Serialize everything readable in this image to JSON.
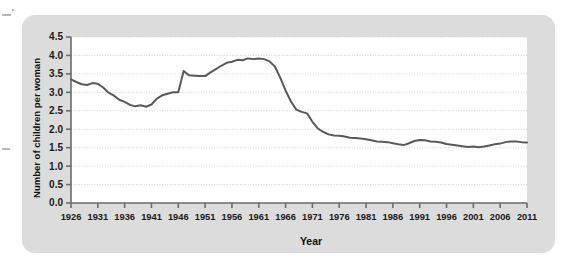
{
  "figure": {
    "panel_background": "#dcdcdc",
    "plot_background": "#ffffff",
    "line_color": "#595959",
    "grid_color": "#c8c8c8",
    "axis_color": "#6b6b6b"
  },
  "chart_data": {
    "type": "line",
    "title": "",
    "xlabel": "Year",
    "ylabel": "Number of children per woman",
    "xlim": [
      1926,
      2011
    ],
    "ylim": [
      0.0,
      4.5
    ],
    "grid": true,
    "legend": null,
    "xticks": [
      1926,
      1931,
      1936,
      1941,
      1946,
      1951,
      1956,
      1961,
      1966,
      1971,
      1976,
      1981,
      1986,
      1991,
      1996,
      2001,
      2006,
      2011
    ],
    "xtick_labels": [
      "1926",
      "1931",
      "1936",
      "1941",
      "1946",
      "1951",
      "1956",
      "1961",
      "1966",
      "1971",
      "1976",
      "1981",
      "1986",
      "1991",
      "1996",
      "2001",
      "2006",
      "2011"
    ],
    "yticks": [
      0.0,
      0.5,
      1.0,
      1.5,
      2.0,
      2.5,
      3.0,
      3.5,
      4.0,
      4.5
    ],
    "ytick_labels": [
      "0.0",
      "0.5",
      "1.0",
      "1.5",
      "2.0",
      "2.5",
      "3.0",
      "3.5",
      "4.0",
      "4.5"
    ],
    "series": [
      {
        "name": "Total fertility rate",
        "x": [
          1926,
          1927,
          1928,
          1929,
          1930,
          1931,
          1932,
          1933,
          1934,
          1935,
          1936,
          1937,
          1938,
          1939,
          1940,
          1941,
          1942,
          1943,
          1944,
          1945,
          1946,
          1947,
          1948,
          1949,
          1950,
          1951,
          1952,
          1953,
          1954,
          1955,
          1956,
          1957,
          1958,
          1959,
          1960,
          1961,
          1962,
          1963,
          1964,
          1965,
          1966,
          1967,
          1968,
          1969,
          1970,
          1971,
          1972,
          1973,
          1974,
          1975,
          1976,
          1977,
          1978,
          1979,
          1980,
          1981,
          1982,
          1983,
          1984,
          1985,
          1986,
          1987,
          1988,
          1989,
          1990,
          1991,
          1992,
          1993,
          1994,
          1995,
          1996,
          1997,
          1998,
          1999,
          2000,
          2001,
          2002,
          2003,
          2004,
          2005,
          2006,
          2007,
          2008,
          2009,
          2010,
          2011
        ],
        "y": [
          3.35,
          3.28,
          3.22,
          3.2,
          3.25,
          3.23,
          3.13,
          2.99,
          2.91,
          2.8,
          2.74,
          2.66,
          2.62,
          2.65,
          2.61,
          2.67,
          2.83,
          2.92,
          2.96,
          3.0,
          3.0,
          3.58,
          3.46,
          3.45,
          3.44,
          3.44,
          3.54,
          3.63,
          3.72,
          3.8,
          3.83,
          3.88,
          3.87,
          3.92,
          3.9,
          3.92,
          3.9,
          3.84,
          3.7,
          3.4,
          3.05,
          2.75,
          2.53,
          2.47,
          2.43,
          2.2,
          2.02,
          1.93,
          1.86,
          1.83,
          1.82,
          1.8,
          1.77,
          1.76,
          1.75,
          1.73,
          1.7,
          1.67,
          1.66,
          1.65,
          1.62,
          1.59,
          1.57,
          1.62,
          1.68,
          1.71,
          1.7,
          1.67,
          1.66,
          1.64,
          1.6,
          1.58,
          1.56,
          1.54,
          1.52,
          1.53,
          1.51,
          1.53,
          1.56,
          1.59,
          1.61,
          1.65,
          1.67,
          1.67,
          1.65,
          1.64
        ]
      }
    ]
  }
}
